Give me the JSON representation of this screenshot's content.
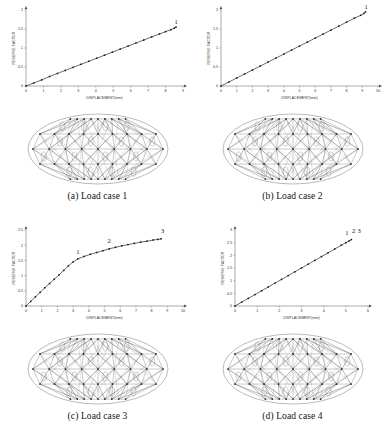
{
  "figure": {
    "background": "#ffffff",
    "ink": "#2a2a2a"
  },
  "panels": [
    {
      "id": "a",
      "caption": "(a) Load case 1",
      "mesh_name": "elliptical-lattice-structure-1",
      "chart_data": {
        "type": "line",
        "title": "",
        "xlabel": "DISPLACEMENT(mm)",
        "ylabel": "RESERVE FACTOR",
        "xlim": [
          0,
          9
        ],
        "ylim": [
          0,
          2
        ],
        "xticks": [
          0,
          1,
          2,
          3,
          4,
          5,
          6,
          7,
          8,
          9
        ],
        "yticks": [
          0,
          0.5,
          1,
          1.5,
          2
        ],
        "ytick_labels": [
          "0",
          "0.5",
          "1",
          "1.5",
          "2"
        ],
        "grid": false,
        "legend": "none",
        "markers": "filled-squares",
        "series": [
          {
            "name": "load path 1",
            "x": [
              0,
              0.45,
              0.9,
              1.35,
              1.8,
              2.25,
              2.7,
              3.15,
              3.6,
              4.05,
              4.5,
              4.95,
              5.4,
              5.85,
              6.3,
              6.75,
              7.2,
              7.65,
              8.0,
              8.3,
              8.5,
              8.6
            ],
            "y": [
              0,
              0.08,
              0.16,
              0.25,
              0.33,
              0.41,
              0.49,
              0.57,
              0.65,
              0.73,
              0.81,
              0.89,
              0.97,
              1.05,
              1.13,
              1.21,
              1.29,
              1.37,
              1.43,
              1.48,
              1.52,
              1.55
            ]
          }
        ],
        "annotations": [
          {
            "label": "1",
            "x": 8.6,
            "y": 1.62
          }
        ]
      }
    },
    {
      "id": "b",
      "caption": "(b) Load case 2",
      "mesh_name": "elliptical-lattice-structure-2",
      "chart_data": {
        "type": "line",
        "title": "",
        "xlabel": "DISPLACEMENT(mm)",
        "ylabel": "RESERVE FACTOR",
        "xlim": [
          0,
          10
        ],
        "ylim": [
          0,
          2
        ],
        "xticks": [
          0,
          1,
          2,
          3,
          4,
          5,
          6,
          7,
          8,
          9,
          10
        ],
        "yticks": [
          0,
          0.5,
          1,
          1.5,
          2
        ],
        "ytick_labels": [
          "0",
          "0.5",
          "1",
          "1.5",
          "2"
        ],
        "grid": false,
        "legend": "none",
        "markers": "filled-squares",
        "series": [
          {
            "name": "load path 1",
            "x": [
              0,
              0.5,
              1.0,
              1.5,
              2.0,
              2.5,
              3.0,
              3.5,
              4.0,
              4.5,
              5.0,
              5.5,
              6.0,
              6.5,
              7.0,
              7.5,
              8.0,
              8.5,
              8.9,
              9.1,
              9.2
            ],
            "y": [
              0,
              0.105,
              0.21,
              0.315,
              0.42,
              0.525,
              0.63,
              0.735,
              0.84,
              0.945,
              1.05,
              1.155,
              1.26,
              1.365,
              1.47,
              1.575,
              1.68,
              1.785,
              1.86,
              1.91,
              1.95
            ]
          }
        ],
        "annotations": [
          {
            "label": "1",
            "x": 9.25,
            "y": 2.02
          }
        ]
      }
    },
    {
      "id": "c",
      "caption": "(c) Load case 3",
      "mesh_name": "elliptical-lattice-structure-3",
      "chart_data": {
        "type": "line",
        "title": "",
        "xlabel": "DISPLACEMENT(mm)",
        "ylabel": "RESERVE FACTOR",
        "xlim": [
          0,
          10
        ],
        "ylim": [
          0,
          2.5
        ],
        "xticks": [
          0,
          1,
          2,
          3,
          4,
          5,
          6,
          7,
          8,
          9,
          10
        ],
        "yticks": [
          0,
          0.5,
          1,
          1.5,
          2,
          2.5
        ],
        "ytick_labels": [
          "0",
          "0.5",
          "1",
          "1.5",
          "2",
          "2.5"
        ],
        "grid": false,
        "legend": "none",
        "markers": "filled-squares",
        "series": [
          {
            "name": "load path 1",
            "x": [
              0,
              0.3,
              0.6,
              0.9,
              1.2,
              1.5,
              1.8,
              2.1,
              2.4,
              2.7,
              3.0,
              3.3,
              3.7,
              4.1,
              4.5,
              4.9,
              5.3,
              5.7,
              6.1,
              6.5,
              6.9,
              7.3,
              7.7,
              8.1,
              8.4,
              8.6
            ],
            "y": [
              0,
              0.15,
              0.3,
              0.45,
              0.6,
              0.74,
              0.88,
              1.02,
              1.17,
              1.32,
              1.45,
              1.55,
              1.63,
              1.7,
              1.76,
              1.82,
              1.88,
              1.93,
              1.98,
              2.02,
              2.06,
              2.1,
              2.13,
              2.17,
              2.19,
              2.21
            ]
          }
        ],
        "annotations": [
          {
            "label": "1",
            "x": 3.3,
            "y": 1.72
          },
          {
            "label": "2",
            "x": 5.3,
            "y": 2.07
          },
          {
            "label": "3",
            "x": 8.7,
            "y": 2.4
          }
        ]
      }
    },
    {
      "id": "d",
      "caption": "(d) Load case 4",
      "mesh_name": "elliptical-lattice-structure-4",
      "chart_data": {
        "type": "line",
        "title": "",
        "xlabel": "DISPLACEMENT(mm)",
        "ylabel": "RESERVE FACTOR",
        "xlim": [
          0,
          6
        ],
        "ylim": [
          0,
          3
        ],
        "xticks": [
          0,
          1,
          2,
          3,
          4,
          5,
          6
        ],
        "yticks": [
          0,
          0.5,
          1,
          1.5,
          2,
          2.5,
          3
        ],
        "ytick_labels": [
          "0",
          "0.5",
          "1",
          "1.5",
          "2",
          "2.5",
          "3"
        ],
        "grid": false,
        "legend": "none",
        "markers": "filled-squares",
        "series": [
          {
            "name": "load path 1",
            "x": [
              0,
              0.3,
              0.6,
              0.9,
              1.2,
              1.5,
              1.8,
              2.1,
              2.4,
              2.7,
              3.0,
              3.3,
              3.6,
              3.9,
              4.2,
              4.5,
              4.8,
              5.0,
              5.15,
              5.25
            ],
            "y": [
              0,
              0.15,
              0.3,
              0.45,
              0.6,
              0.75,
              0.9,
              1.05,
              1.2,
              1.35,
              1.5,
              1.65,
              1.8,
              1.95,
              2.1,
              2.25,
              2.4,
              2.5,
              2.57,
              2.62
            ]
          }
        ],
        "annotations": [
          {
            "label": "1",
            "x": 5.05,
            "y": 2.8
          },
          {
            "label": "2",
            "x": 5.35,
            "y": 2.88
          },
          {
            "label": "3",
            "x": 5.6,
            "y": 2.88
          }
        ]
      }
    }
  ]
}
